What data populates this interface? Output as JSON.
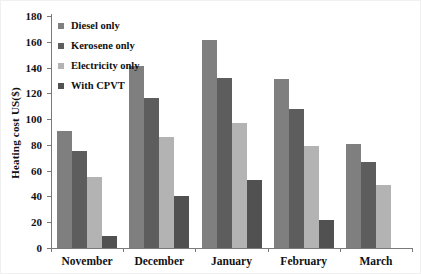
{
  "figure": {
    "background": "#ffffff",
    "border_color": "#f0f0f0"
  },
  "axes": {
    "line_color": "#7a7a7a",
    "tick_color": "#7a7a7a",
    "text_color": "#111111"
  },
  "chart_data": {
    "type": "bar",
    "title": "",
    "xlabel": "",
    "ylabel": "Heating cost US($)",
    "ylim": [
      0,
      180
    ],
    "yticks": [
      0,
      20,
      40,
      60,
      80,
      100,
      120,
      140,
      160,
      180
    ],
    "grid": false,
    "legend_position": "top-left-inside",
    "categories": [
      "November",
      "December",
      "January",
      "February",
      "March"
    ],
    "series": [
      {
        "name": "Diesel only",
        "color": "#7f7f7f",
        "values": [
          91,
          141,
          161,
          131,
          81
        ]
      },
      {
        "name": "Kerosene only",
        "color": "#5d5d5d",
        "values": [
          75,
          116,
          132,
          108,
          67
        ]
      },
      {
        "name": "Electricity only",
        "color": "#b3b3b3",
        "values": [
          55,
          86,
          97,
          79,
          49
        ]
      },
      {
        "name": "With CPVT",
        "color": "#515151",
        "values": [
          9,
          40,
          53,
          22,
          0
        ]
      }
    ]
  }
}
